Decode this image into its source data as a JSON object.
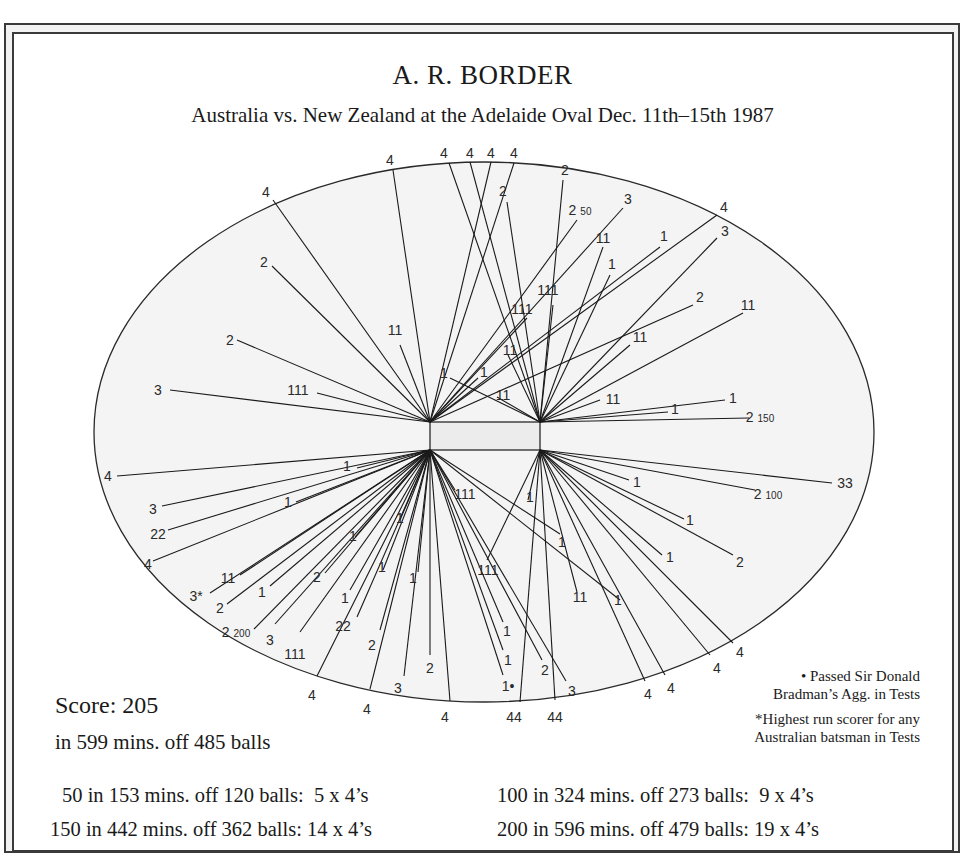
{
  "header": {
    "title": "A. R. BORDER",
    "subtitle": "Australia vs. New Zealand at the Adelaide Oval Dec. 11th–15th 1987"
  },
  "summary": {
    "score": "Score: 205",
    "detail": "in 599 mins. off 485 balls"
  },
  "notes": {
    "bullet_line1": "• Passed Sir Donald",
    "bullet_line2": "Bradman’s Agg. in Tests",
    "star_line1": "*Highest run scorer for any",
    "star_line2": "Australian batsman in Tests"
  },
  "milestones": [
    "50 in 153 mins. off 120 balls:  5 x 4’s",
    "100 in 324 mins. off 273 balls:  9 x 4’s",
    "150 in 442 mins. off 362 balls: 14 x 4’s",
    "200 in 596 mins. off 479 balls: 19 x 4’s"
  ],
  "colors": {
    "ink": "#1a1a1a",
    "field": "#f4f4f4",
    "pitch": "#ececec"
  },
  "chart_data": {
    "type": "wagon-wheel",
    "title": "A. R. BORDER",
    "subtitle": "Australia vs. New Zealand at the Adelaide Oval Dec. 11th–15th 1987",
    "field": {
      "cx": 484,
      "cy": 432,
      "rx": 390,
      "ry": 270
    },
    "pitch": {
      "x": 430,
      "y": 422,
      "w": 110,
      "h": 28
    },
    "origins": {
      "TL": [
        430,
        422
      ],
      "TR": [
        540,
        422
      ],
      "BL": [
        430,
        450
      ],
      "BR": [
        540,
        450
      ]
    },
    "milestone_markers": [
      "50",
      "100",
      "150",
      "200"
    ],
    "shots": [
      {
        "label": "4",
        "o": "TL",
        "end": [
          273,
          200
        ],
        "lx": 266,
        "ly": 192
      },
      {
        "label": "4",
        "o": "TL",
        "end": [
          393,
          170
        ],
        "lx": 390,
        "ly": 160
      },
      {
        "label": "4",
        "o": "TR",
        "end": [
          449,
          163
        ],
        "lx": 444,
        "ly": 153
      },
      {
        "label": "4",
        "o": "TR",
        "end": [
          470,
          162
        ],
        "lx": 470,
        "ly": 153
      },
      {
        "label": "4",
        "o": "TL",
        "end": [
          491,
          162
        ],
        "lx": 491,
        "ly": 153
      },
      {
        "label": "4",
        "o": "TL",
        "end": [
          514,
          163
        ],
        "lx": 514,
        "ly": 153
      },
      {
        "label": "2",
        "o": "TL",
        "end": [
          272,
          266
        ],
        "lx": 264,
        "ly": 262
      },
      {
        "label": "2",
        "o": "TL",
        "end": [
          237,
          340
        ],
        "lx": 230,
        "ly": 340
      },
      {
        "label": "11",
        "o": "TL",
        "end": [
          400,
          345
        ],
        "lx": 395,
        "ly": 330
      },
      {
        "label": "3",
        "o": "TL",
        "end": [
          170,
          390
        ],
        "lx": 158,
        "ly": 390
      },
      {
        "label": "111",
        "o": "TL",
        "end": [
          317,
          393
        ],
        "lx": 298,
        "ly": 390
      },
      {
        "label": "2",
        "o": "TR",
        "end": [
          507,
          202
        ],
        "lx": 503,
        "ly": 191
      },
      {
        "label": "2",
        "o": "TR",
        "end": [
          563,
          180
        ],
        "lx": 565,
        "ly": 170
      },
      {
        "label": "2 50",
        "o": "TL",
        "end": [
          577,
          220
        ],
        "lx": 580,
        "ly": 210
      },
      {
        "label": "3",
        "o": "TL",
        "end": [
          623,
          208
        ],
        "lx": 628,
        "ly": 199
      },
      {
        "label": "11",
        "o": "TR",
        "end": [
          603,
          247
        ],
        "lx": 603,
        "ly": 238
      },
      {
        "label": "1",
        "o": "TR",
        "end": [
          610,
          275
        ],
        "lx": 612,
        "ly": 264
      },
      {
        "label": "1",
        "o": "TL",
        "end": [
          660,
          247
        ],
        "lx": 664,
        "ly": 236
      },
      {
        "label": "4",
        "o": "TL",
        "end": [
          717,
          215
        ],
        "lx": 724,
        "ly": 207
      },
      {
        "label": "3",
        "o": "TR",
        "end": [
          717,
          238
        ],
        "lx": 725,
        "ly": 231
      },
      {
        "label": "111",
        "o": "TR",
        "end": [
          553,
          305
        ],
        "lx": 548,
        "ly": 290
      },
      {
        "label": "111",
        "o": "TL",
        "end": [
          527,
          318
        ],
        "lx": 522,
        "ly": 309
      },
      {
        "label": "2",
        "o": "TL",
        "end": [
          693,
          305
        ],
        "lx": 700,
        "ly": 297
      },
      {
        "label": "11",
        "o": "TR",
        "end": [
          743,
          313
        ],
        "lx": 748,
        "ly": 305
      },
      {
        "label": "11",
        "o": "TR",
        "end": [
          630,
          345
        ],
        "lx": 640,
        "ly": 337
      },
      {
        "label": "11",
        "o": "TR",
        "end": [
          508,
          355
        ],
        "lx": 510,
        "ly": 350
      },
      {
        "label": "1",
        "o": "TR",
        "end": [
          450,
          378
        ],
        "lx": 444,
        "ly": 373
      },
      {
        "label": "1",
        "o": "TL",
        "end": [
          478,
          378
        ],
        "lx": 484,
        "ly": 372
      },
      {
        "label": "11",
        "o": "TR",
        "end": [
          497,
          397
        ],
        "lx": 503,
        "ly": 395
      },
      {
        "label": "11",
        "o": "TR",
        "end": [
          600,
          400
        ],
        "lx": 613,
        "ly": 399
      },
      {
        "label": "1",
        "o": "TR",
        "end": [
          725,
          400
        ],
        "lx": 733,
        "ly": 398
      },
      {
        "label": "1",
        "o": "TR",
        "end": [
          668,
          412
        ],
        "lx": 675,
        "ly": 409
      },
      {
        "label": "2 150",
        "o": "TR",
        "end": [
          749,
          418
        ],
        "lx": 760,
        "ly": 417
      },
      {
        "label": "4",
        "o": "BL",
        "end": [
          117,
          476
        ],
        "lx": 108,
        "ly": 476
      },
      {
        "label": "1",
        "o": "BL",
        "end": [
          357,
          468
        ],
        "lx": 347,
        "ly": 466
      },
      {
        "label": "3",
        "o": "BL",
        "end": [
          162,
          506
        ],
        "lx": 153,
        "ly": 509
      },
      {
        "label": "1",
        "o": "BL",
        "end": [
          296,
          502
        ],
        "lx": 288,
        "ly": 502
      },
      {
        "label": "22",
        "o": "BL",
        "end": [
          168,
          530
        ],
        "lx": 158,
        "ly": 534
      },
      {
        "label": "4",
        "o": "BL",
        "end": [
          153,
          561
        ],
        "lx": 148,
        "ly": 564
      },
      {
        "label": "1",
        "o": "BL",
        "end": [
          355,
          537
        ],
        "lx": 353,
        "ly": 536
      },
      {
        "label": "1",
        "o": "BL",
        "end": [
          400,
          520
        ],
        "lx": 400,
        "ly": 518
      },
      {
        "label": "11",
        "o": "BL",
        "end": [
          240,
          575
        ],
        "lx": 228,
        "ly": 578
      },
      {
        "label": "3*",
        "o": "BL",
        "end": [
          210,
          593
        ],
        "lx": 196,
        "ly": 596
      },
      {
        "label": "2",
        "o": "BL",
        "end": [
          227,
          604
        ],
        "lx": 220,
        "ly": 608
      },
      {
        "label": "1",
        "o": "BL",
        "end": [
          270,
          586
        ],
        "lx": 262,
        "ly": 592
      },
      {
        "label": "2",
        "o": "BL",
        "end": [
          325,
          573
        ],
        "lx": 317,
        "ly": 577
      },
      {
        "label": "1",
        "o": "BL",
        "end": [
          383,
          570
        ],
        "lx": 382,
        "ly": 567
      },
      {
        "label": "1",
        "o": "BL",
        "end": [
          350,
          590
        ],
        "lx": 345,
        "ly": 598
      },
      {
        "label": "1",
        "o": "BL",
        "end": [
          418,
          572
        ],
        "lx": 413,
        "ly": 578
      },
      {
        "label": "2 200",
        "o": "BL",
        "end": [
          254,
          629
        ],
        "lx": 236,
        "ly": 632
      },
      {
        "label": "3",
        "o": "BL",
        "end": [
          275,
          624
        ],
        "lx": 270,
        "ly": 640
      },
      {
        "label": "111",
        "o": "BL",
        "end": [
          300,
          632
        ],
        "lx": 295,
        "ly": 654
      },
      {
        "label": "22",
        "o": "BL",
        "end": [
          357,
          617
        ],
        "lx": 343,
        "ly": 626
      },
      {
        "label": "2",
        "o": "BL",
        "end": [
          380,
          630
        ],
        "lx": 372,
        "ly": 645
      },
      {
        "label": "2",
        "o": "BL",
        "end": [
          430,
          655
        ],
        "lx": 430,
        "ly": 668
      },
      {
        "label": "3",
        "o": "BL",
        "end": [
          404,
          676
        ],
        "lx": 398,
        "ly": 688
      },
      {
        "label": "4",
        "o": "BL",
        "end": [
          317,
          676
        ],
        "lx": 312,
        "ly": 695
      },
      {
        "label": "4",
        "o": "BL",
        "end": [
          370,
          689
        ],
        "lx": 367,
        "ly": 709
      },
      {
        "label": "111",
        "o": "BL",
        "end": [
          455,
          490
        ],
        "lx": 465,
        "ly": 494
      },
      {
        "label": "1",
        "o": "BR",
        "end": [
          528,
          500
        ],
        "lx": 530,
        "ly": 497
      },
      {
        "label": "1",
        "o": "BL",
        "end": [
          560,
          534
        ],
        "lx": 562,
        "ly": 542
      },
      {
        "label": "111",
        "o": "BR",
        "end": [
          487,
          560
        ],
        "lx": 488,
        "ly": 570
      },
      {
        "label": "1",
        "o": "BL",
        "end": [
          503,
          622
        ],
        "lx": 507,
        "ly": 631
      },
      {
        "label": "1",
        "o": "BL",
        "end": [
          503,
          650
        ],
        "lx": 508,
        "ly": 660
      },
      {
        "label": "1•",
        "o": "BL",
        "end": [
          503,
          675
        ],
        "lx": 508,
        "ly": 686
      },
      {
        "label": "11",
        "o": "BR",
        "end": [
          577,
          592
        ],
        "lx": 580,
        "ly": 597
      },
      {
        "label": "2",
        "o": "BL",
        "end": [
          542,
          660
        ],
        "lx": 545,
        "ly": 670
      },
      {
        "label": "3",
        "o": "BL",
        "end": [
          566,
          681
        ],
        "lx": 572,
        "ly": 691
      },
      {
        "label": "44",
        "o": "BR",
        "end": [
          520,
          702
        ],
        "lx": 514,
        "ly": 717
      },
      {
        "label": "44",
        "o": "BR",
        "end": [
          555,
          700
        ],
        "lx": 555,
        "ly": 717
      },
      {
        "label": "4",
        "o": "BL",
        "end": [
          450,
          701
        ],
        "lx": 445,
        "ly": 717
      },
      {
        "label": "1",
        "o": "BR",
        "end": [
          629,
          480
        ],
        "lx": 637,
        "ly": 482
      },
      {
        "label": "2 100",
        "o": "BR",
        "end": [
          755,
          490
        ],
        "lx": 768,
        "ly": 494
      },
      {
        "label": "33",
        "o": "BR",
        "end": [
          832,
          483
        ],
        "lx": 845,
        "ly": 483
      },
      {
        "label": "1",
        "o": "BR",
        "end": [
          684,
          519
        ],
        "lx": 690,
        "ly": 520
      },
      {
        "label": "2",
        "o": "BR",
        "end": [
          733,
          555
        ],
        "lx": 740,
        "ly": 562
      },
      {
        "label": "1",
        "o": "BR",
        "end": [
          662,
          555
        ],
        "lx": 670,
        "ly": 557
      },
      {
        "label": "4",
        "o": "BR",
        "end": [
          645,
          681
        ],
        "lx": 648,
        "ly": 694
      },
      {
        "label": "4",
        "o": "BR",
        "end": [
          665,
          675
        ],
        "lx": 671,
        "ly": 688
      },
      {
        "label": "4",
        "o": "BR",
        "end": [
          710,
          655
        ],
        "lx": 717,
        "ly": 668
      },
      {
        "label": "4",
        "o": "BR",
        "end": [
          733,
          643
        ],
        "lx": 740,
        "ly": 652
      },
      {
        "label": "1",
        "o": "BL",
        "end": [
          620,
          600
        ],
        "lx": 618,
        "ly": 600
      }
    ]
  }
}
